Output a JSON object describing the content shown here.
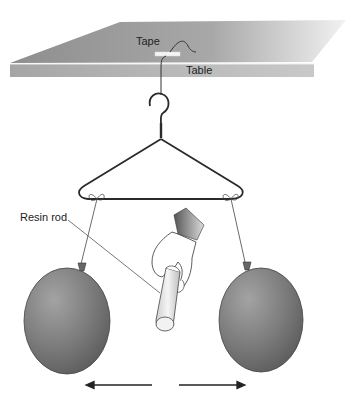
{
  "diagram": {
    "labels": {
      "tape": "Tape",
      "table": "Table",
      "rod": "Resin rod"
    },
    "objects": [
      "table",
      "tape",
      "string",
      "hanger",
      "left-balloon",
      "right-balloon",
      "hand",
      "resin-rod"
    ],
    "arrows": [
      {
        "direction": "left"
      },
      {
        "direction": "right"
      }
    ],
    "colors": {
      "table_top": "#9a9a9a",
      "table_edge": "#b5b5b5",
      "balloon": "#7a7a7a",
      "line": "#333333"
    }
  }
}
